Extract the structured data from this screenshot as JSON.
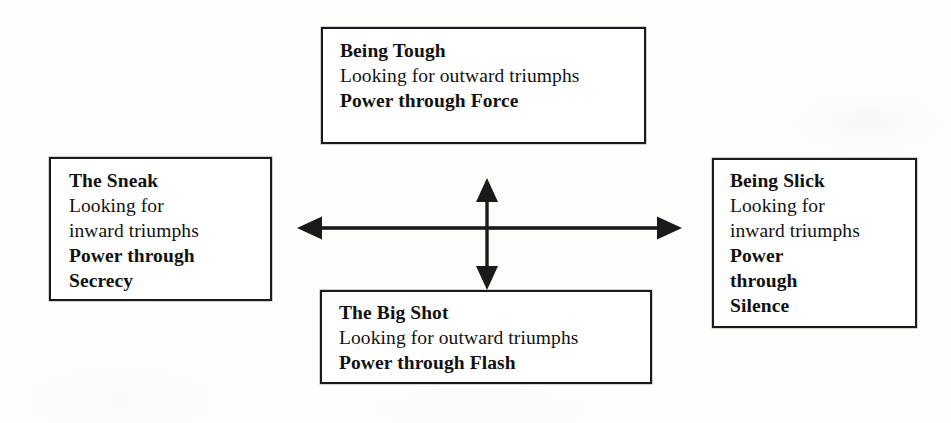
{
  "diagram": {
    "ink_color": "#1a1a1a",
    "paper_color": "#fdfdfc",
    "boxes": {
      "top": {
        "name": "Being Tough",
        "lines": [
          {
            "text": "Being Tough",
            "bold": true
          },
          {
            "text": "Looking for outward triumphs",
            "bold": false
          },
          {
            "text": "Power through Force",
            "bold": true
          }
        ]
      },
      "left": {
        "name": "The Sneak",
        "lines": [
          {
            "text": "The Sneak",
            "bold": true
          },
          {
            "text": "Looking for",
            "bold": false
          },
          {
            "text": "inward triumphs",
            "bold": false
          },
          {
            "text": "Power through",
            "bold": true
          },
          {
            "text": "Secrecy",
            "bold": true
          }
        ]
      },
      "right": {
        "name": "Being Slick",
        "lines": [
          {
            "text": "Being Slick",
            "bold": true
          },
          {
            "text": "Looking for",
            "bold": false
          },
          {
            "text": "inward triumphs",
            "bold": false
          },
          {
            "text": "Power",
            "bold": true
          },
          {
            "text": "through",
            "bold": true
          },
          {
            "text": "Silence",
            "bold": true
          }
        ]
      },
      "bottom": {
        "name": "The Big Shot",
        "lines": [
          {
            "text": "The Big Shot",
            "bold": true
          },
          {
            "text": "Looking for outward triumphs",
            "bold": false
          },
          {
            "text": "Power through Flash",
            "bold": true
          }
        ]
      }
    },
    "axes": {
      "horizontal": {
        "icon": "double-headed-horizontal-arrow",
        "label": ""
      },
      "vertical": {
        "icon": "double-headed-vertical-arrow",
        "label": ""
      }
    }
  }
}
